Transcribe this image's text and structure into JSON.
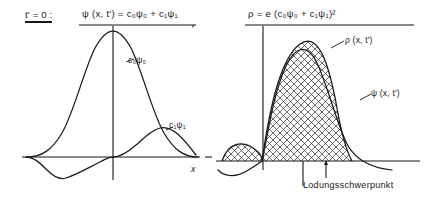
{
  "figure": {
    "time_condition": "t' = 0 :",
    "left_panel": {
      "formula": "ψ (x, t') = c₀ψ₀ + c₁ψ₁",
      "curve_label_ground": "c₀ψ₀",
      "curve_label_excited": "c₁ψ₁",
      "axis_label_x": "x"
    },
    "right_panel": {
      "formula": "ρ = e (c₀ψ₀ + c₁ψ₁)²",
      "curve_label_density": "ρ (x, t')",
      "curve_label_wavefunction": "ψ (x, t')",
      "centroid_label": "Lodungsschwerpunkt"
    },
    "colors": {
      "ink": "#171717",
      "curve": "#1a1a1a",
      "hatch": "#2b2b2b",
      "background": "#ffffff"
    }
  }
}
